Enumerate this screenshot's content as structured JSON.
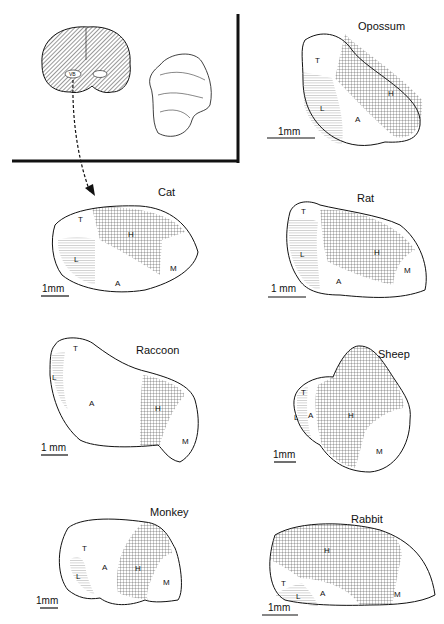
{
  "figure": {
    "inset": {
      "brain_section_label": "VB",
      "description": "coronal brain section with VB highlighted; arrow points to cat panel"
    },
    "scale_label": "1mm",
    "panels": [
      {
        "id": "opossum",
        "title": "Opossum",
        "regions": [
          "T",
          "H",
          "L",
          "A"
        ],
        "scale": "1mm"
      },
      {
        "id": "cat",
        "title": "Cat",
        "regions": [
          "T",
          "H",
          "L",
          "A",
          "M"
        ],
        "scale": "1mm"
      },
      {
        "id": "rat",
        "title": "Rat",
        "regions": [
          "T",
          "L",
          "H",
          "A",
          "M"
        ],
        "scale": "1 mm"
      },
      {
        "id": "raccoon",
        "title": "Raccoon",
        "regions": [
          "T",
          "L",
          "A",
          "H",
          "M"
        ],
        "scale": "1 mm"
      },
      {
        "id": "sheep",
        "title": "Sheep",
        "regions": [
          "T",
          "L",
          "A",
          "H",
          "M"
        ],
        "scale": "1mm"
      },
      {
        "id": "monkey",
        "title": "Monkey",
        "regions": [
          "T",
          "A",
          "L",
          "H",
          "M"
        ],
        "scale": "1mm"
      },
      {
        "id": "rabbit",
        "title": "Rabbit",
        "regions": [
          "H",
          "T",
          "L",
          "A",
          "M"
        ],
        "scale": "1mm"
      }
    ],
    "legend_regions": {
      "T": "T",
      "L": "L",
      "A": "A",
      "H": "H",
      "M": "M"
    }
  }
}
